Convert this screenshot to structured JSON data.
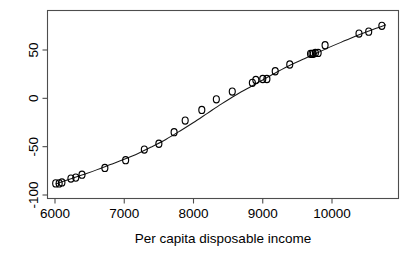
{
  "chart_data": {
    "type": "scatter",
    "title": "",
    "xlabel": "Per capita disposable income",
    "ylabel": "",
    "xlim": [
      5940,
      10800
    ],
    "ylim": [
      -103,
      82
    ],
    "grid": false,
    "legend": null,
    "xticks": [
      6000,
      7000,
      8000,
      9000,
      10000
    ],
    "xtick_labels": [
      "6000",
      "7000",
      "8000",
      "9000",
      "10000"
    ],
    "yticks": [
      50,
      0,
      -50,
      -100
    ],
    "ytick_labels": [
      "50",
      "0",
      "-50",
      "-100"
    ],
    "ytick_label_rotation": -90,
    "marker": "open-circle",
    "series": [
      {
        "name": "observations",
        "x": [
          6010,
          6060,
          6100,
          6230,
          6300,
          6390,
          6720,
          7020,
          7290,
          7500,
          7720,
          7880,
          8120,
          8330,
          8560,
          8850,
          8900,
          9000,
          9060,
          9180,
          9390,
          9690,
          9710,
          9730,
          9760,
          9800,
          9900,
          10390,
          10530,
          10720
        ],
        "y": [
          -88,
          -88,
          -87,
          -83,
          -82,
          -79,
          -72,
          -64,
          -53,
          -47,
          -35,
          -23,
          -12,
          -1,
          7,
          16,
          19,
          20,
          20,
          28,
          35,
          46,
          46,
          46,
          47,
          47,
          55,
          67,
          69,
          75
        ]
      }
    ],
    "fit_line": {
      "name": "fitted curve",
      "x": [
        6010,
        6200,
        6400,
        6600,
        6800,
        7000,
        7200,
        7400,
        7600,
        7800,
        8000,
        8200,
        8400,
        8600,
        8800,
        9000,
        9200,
        9400,
        9600,
        9800,
        10000,
        10200,
        10400,
        10600,
        10780
      ],
      "y": [
        -88.5,
        -84.0,
        -79.0,
        -74.0,
        -68.5,
        -63.0,
        -57.0,
        -50.0,
        -42.5,
        -34.0,
        -25.0,
        -15.5,
        -6.0,
        3.0,
        11.0,
        19.0,
        27.0,
        34.5,
        41.0,
        47.5,
        54.0,
        60.0,
        66.0,
        71.5,
        76.0
      ]
    }
  },
  "colors": {
    "frame": "#4d4d4d",
    "point": "#000000",
    "curve": "#1a1a1a",
    "background": "#ffffff",
    "text": "#000000"
  }
}
